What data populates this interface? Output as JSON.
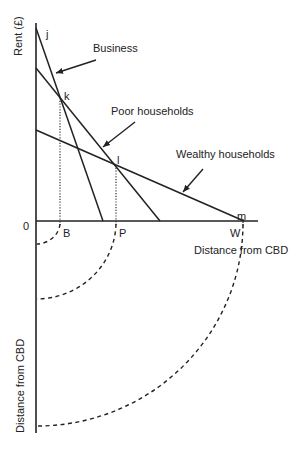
{
  "diagram": {
    "colors": {
      "line": "#222222",
      "background": "#ffffff"
    },
    "axes": {
      "y_label": "Rent (£)",
      "x_label": "Distance from CBD",
      "lower_y_label": "Distance from CBD",
      "origin_label": "0"
    },
    "bid_rent_lines": [
      {
        "name": "Business",
        "label": "Business",
        "start_point": "j",
        "axis_point": "B"
      },
      {
        "name": "Poor households",
        "label": "Poor households",
        "start_point": "k",
        "axis_point": "P"
      },
      {
        "name": "Wealthy households",
        "label": "Wealthy households",
        "start_point": "l",
        "axis_point": "W"
      }
    ],
    "points": {
      "j": "j",
      "k": "k",
      "l": "l",
      "m": "m"
    },
    "axis_markers": {
      "B": "B",
      "P": "P",
      "W": "W"
    },
    "zones": [
      {
        "marker": "B",
        "description": "Business zone radius"
      },
      {
        "marker": "P",
        "description": "Poor households zone radius"
      },
      {
        "marker": "W",
        "description": "Wealthy households zone radius"
      }
    ]
  }
}
